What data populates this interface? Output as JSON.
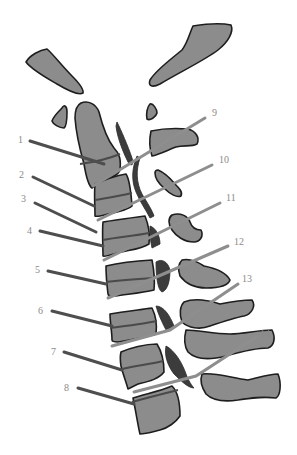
{
  "diagram": {
    "type": "anatomical-labeled-illustration",
    "colors": {
      "bone_fill": "#8c8c8c",
      "bone_outline": "#1e1e1e",
      "left_leader": "#4e4e4e",
      "right_leader": "#8e8e8e",
      "label_text": "#8a8a8a",
      "background": "#ffffff"
    },
    "labels_left": [
      {
        "id": "1",
        "text": "1"
      },
      {
        "id": "2",
        "text": "2"
      },
      {
        "id": "3",
        "text": "3"
      },
      {
        "id": "4",
        "text": "4"
      },
      {
        "id": "5",
        "text": "5"
      },
      {
        "id": "6",
        "text": "6"
      },
      {
        "id": "7",
        "text": "7"
      },
      {
        "id": "8",
        "text": "8"
      }
    ],
    "labels_right": [
      {
        "id": "9",
        "text": "9"
      },
      {
        "id": "10",
        "text": "10"
      },
      {
        "id": "11",
        "text": "11"
      },
      {
        "id": "12",
        "text": "12"
      },
      {
        "id": "13",
        "text": "13"
      },
      {
        "id": "14",
        "text": "14"
      }
    ]
  }
}
